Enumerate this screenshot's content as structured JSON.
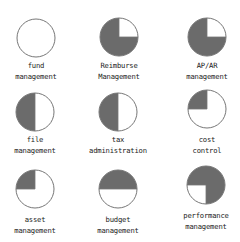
{
  "chart_data": {
    "type": "pie-icon-grid",
    "title": "",
    "fill_color": "#6b6b6b",
    "outline_color": "#777777",
    "grid": {
      "rows": 3,
      "cols": 3
    },
    "items": [
      {
        "line1": "fund",
        "line2": "management",
        "filled_quadrants": [],
        "filled_fraction": 0.0
      },
      {
        "line1": "Reimburse",
        "line2": "Management",
        "filled_quadrants": [
          "top-left",
          "bottom-left",
          "bottom-right"
        ],
        "filled_fraction": 0.75
      },
      {
        "line1": "AP/AR",
        "line2": "management",
        "filled_quadrants": [
          "top-left",
          "bottom-left",
          "bottom-right"
        ],
        "filled_fraction": 0.75
      },
      {
        "line1": "file",
        "line2": "management",
        "filled_quadrants": [
          "top-left",
          "bottom-left"
        ],
        "filled_fraction": 0.5
      },
      {
        "line1": "tax",
        "line2": "administration",
        "filled_quadrants": [
          "top-left",
          "bottom-left"
        ],
        "filled_fraction": 0.5
      },
      {
        "line1": "cost",
        "line2": "control",
        "filled_quadrants": [
          "top-left"
        ],
        "filled_fraction": 0.25
      },
      {
        "line1": "asset",
        "line2": "management",
        "filled_quadrants": [
          "top-left"
        ],
        "filled_fraction": 0.25
      },
      {
        "line1": "budget",
        "line2": "management",
        "filled_quadrants": [
          "top-left",
          "top-right"
        ],
        "filled_fraction": 0.5
      },
      {
        "line1": "performance",
        "line2": "management",
        "filled_quadrants": [
          "top-left",
          "top-right",
          "bottom-right"
        ],
        "filled_fraction": 0.75
      }
    ]
  }
}
